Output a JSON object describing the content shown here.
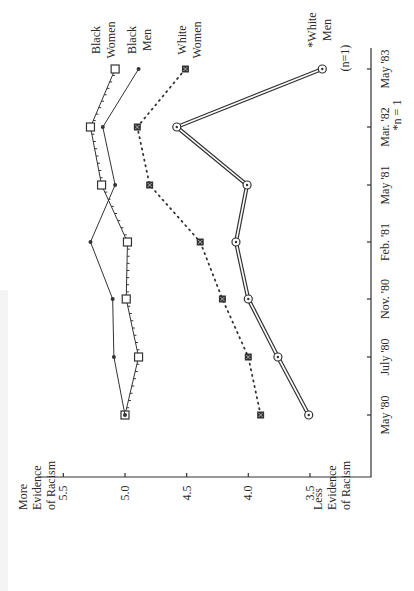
{
  "chart_data": {
    "type": "line",
    "orientation": "rotated-90",
    "title": "",
    "xlabel": "",
    "ylabel_top": "More Evidence of Racism",
    "ylabel_bottom": "Less Evidence of Racism",
    "categories": [
      "May '80",
      "July '80",
      "Nov. '80",
      "Feb. '81",
      "May '81",
      "Mar. '82",
      "May '83"
    ],
    "yticks": [
      "5.5",
      "5.0",
      "4.5",
      "4.0",
      "3.5"
    ],
    "ytick_values": [
      5.5,
      5.0,
      4.5,
      4.0,
      3.5
    ],
    "ylim": [
      3.1,
      5.6
    ],
    "grid": false,
    "series": [
      {
        "name": "Black Women",
        "label_lines": [
          "Black",
          "Women"
        ],
        "marker": "open-square",
        "line": "solid-ticked",
        "values": [
          5.0,
          4.89,
          4.99,
          4.98,
          5.19,
          5.28,
          5.08
        ]
      },
      {
        "name": "Black Men",
        "label_lines": [
          "Black",
          "Men"
        ],
        "marker": "dot",
        "line": "solid",
        "values": [
          5.0,
          5.09,
          5.1,
          5.28,
          5.08,
          5.18,
          4.89
        ]
      },
      {
        "name": "White Women",
        "label_lines": [
          "White",
          "Women"
        ],
        "marker": "filled-square",
        "line": "dotted",
        "values": [
          3.9,
          4.0,
          4.21,
          4.39,
          4.8,
          4.9,
          4.51
        ]
      },
      {
        "name": "White Men",
        "label_lines": [
          "*White",
          "Men"
        ],
        "marker": "circle-dot",
        "line": "double",
        "values": [
          3.51,
          3.76,
          4.0,
          4.1,
          4.01,
          4.58,
          3.4
        ]
      }
    ],
    "annotations": [
      "(n=1)",
      "*n = 1"
    ]
  }
}
